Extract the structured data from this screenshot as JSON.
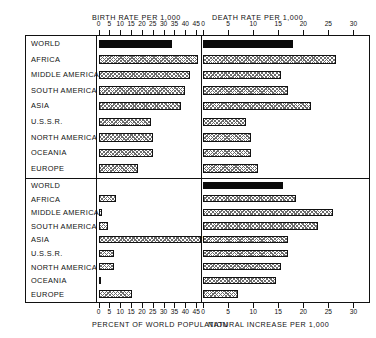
{
  "figure": {
    "rows": [
      "WORLD",
      "AFRICA",
      "MIDDLE AMERICA",
      "SOUTH AMERICA",
      "ASIA",
      "U.S.S.R.",
      "NORTH AMERICA",
      "OCEANIA",
      "EUROPE"
    ]
  },
  "chart_data": [
    {
      "type": "bar",
      "orientation": "horizontal",
      "panel": "top-left",
      "title": "BIRTH RATE PER 1,000",
      "xlabel": "BIRTH RATE PER 1,000",
      "ylabel": "",
      "xlim": [
        0,
        47
      ],
      "ticks": [
        0,
        5,
        10,
        15,
        20,
        25,
        30,
        35,
        40,
        45
      ],
      "tick_labels": [
        "0",
        "5",
        "10",
        "15",
        "20",
        "25",
        "30",
        "35",
        "40",
        "45"
      ],
      "grid": false,
      "categories": [
        "WORLD",
        "AFRICA",
        "MIDDLE AMERICA",
        "SOUTH AMERICA",
        "ASIA",
        "U.S.S.R.",
        "NORTH AMERICA",
        "OCEANIA",
        "EUROPE"
      ],
      "values": [
        34,
        46,
        42,
        40,
        38,
        24,
        25,
        25,
        18
      ],
      "highlight_index": 0,
      "highlight_style": "solid-black",
      "bar_style": "hatched"
    },
    {
      "type": "bar",
      "orientation": "horizontal",
      "panel": "top-right",
      "title": "DEATH RATE PER 1,000",
      "xlabel": "DEATH RATE PER 1,000",
      "ylabel": "",
      "xlim": [
        0,
        33
      ],
      "ticks": [
        0,
        5,
        10,
        15,
        20,
        25,
        30
      ],
      "tick_labels": [
        "0",
        "5",
        "10",
        "15",
        "20",
        "25",
        "30"
      ],
      "grid": false,
      "categories": [
        "WORLD",
        "AFRICA",
        "MIDDLE AMERICA",
        "SOUTH AMERICA",
        "ASIA",
        "U.S.S.R.",
        "NORTH AMERICA",
        "OCEANIA",
        "EUROPE"
      ],
      "values": [
        18,
        26.5,
        15.5,
        17,
        21.5,
        8.5,
        9.5,
        9.5,
        11
      ],
      "highlight_index": 0,
      "highlight_style": "solid-black",
      "bar_style": "hatched"
    },
    {
      "type": "bar",
      "orientation": "horizontal",
      "panel": "bottom-left",
      "title": "PERCENT OF WORLD POPULATION",
      "xlabel": "PERCENT OF WORLD POPULATION",
      "ylabel": "",
      "xlim": [
        0,
        47
      ],
      "ticks": [
        0,
        5,
        10,
        15,
        20,
        25,
        30,
        35,
        40,
        45
      ],
      "tick_labels": [
        "0",
        "5",
        "10",
        "15",
        "20",
        "25",
        "30",
        "35",
        "40",
        "45"
      ],
      "grid": false,
      "categories": [
        "WORLD",
        "AFRICA",
        "MIDDLE AMERICA",
        "SOUTH AMERICA",
        "ASIA",
        "U.S.S.R.",
        "NORTH AMERICA",
        "OCEANIA",
        "EUROPE"
      ],
      "values": [
        null,
        8,
        1.5,
        4.5,
        56,
        7,
        7,
        0.5,
        15.5
      ],
      "value_labels": [
        "",
        "",
        "",
        "",
        "56",
        "",
        "",
        "",
        ""
      ],
      "overflow_index": 4,
      "bar_style": "hatched"
    },
    {
      "type": "bar",
      "orientation": "horizontal",
      "panel": "bottom-right",
      "title": "NATURAL INCREASE PER 1,000",
      "xlabel": "NATURAL INCREASE PER 1,000",
      "ylabel": "",
      "xlim": [
        0,
        33
      ],
      "ticks": [
        0,
        5,
        10,
        15,
        20,
        25,
        30
      ],
      "tick_labels": [
        "0",
        "5",
        "10",
        "15",
        "20",
        "25",
        "30"
      ],
      "grid": false,
      "categories": [
        "WORLD",
        "AFRICA",
        "MIDDLE AMERICA",
        "SOUTH AMERICA",
        "ASIA",
        "U.S.S.R.",
        "NORTH AMERICA",
        "OCEANIA",
        "EUROPE"
      ],
      "values": [
        16,
        18.5,
        26,
        23,
        17,
        17,
        15.5,
        14.5,
        7
      ],
      "highlight_index": 0,
      "highlight_style": "solid-black",
      "bar_style": "hatched"
    }
  ]
}
